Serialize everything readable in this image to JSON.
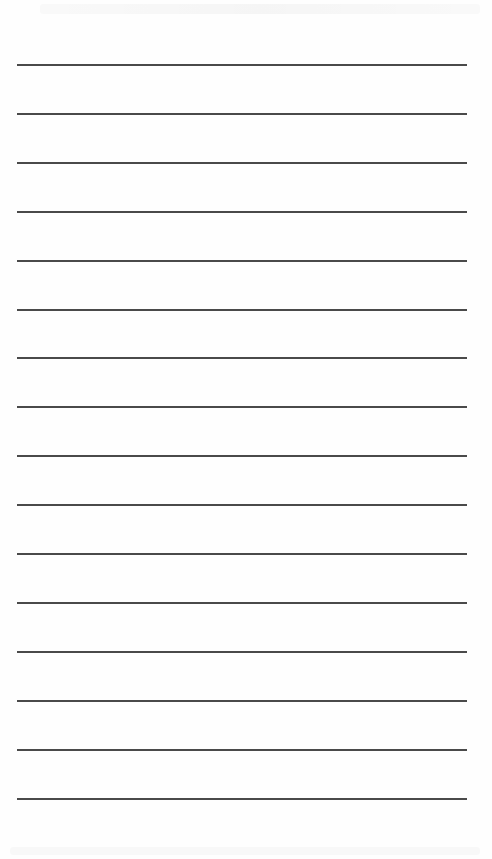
{
  "document": {
    "type": "lined-paper",
    "background_color": "#fefefe",
    "rule_color": "#4a4a4a",
    "rule_count": 16,
    "rule_left": 17,
    "rule_right": 467,
    "first_rule_y": 64,
    "rule_spacing": 48.9
  }
}
